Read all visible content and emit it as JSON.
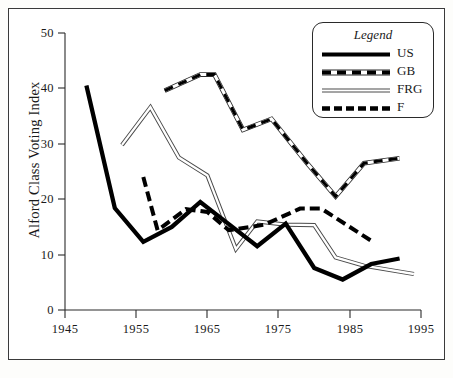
{
  "chart_data": {
    "type": "line",
    "title": "",
    "xlabel": "",
    "ylabel": "Alford Class Voting Index",
    "xlim": [
      1945,
      1995
    ],
    "ylim": [
      0,
      50
    ],
    "xticks": [
      "1945",
      "1955",
      "1965",
      "1975",
      "1985",
      "1995"
    ],
    "yticks": [
      "0",
      "10",
      "20",
      "30",
      "40",
      "50"
    ],
    "grid": false,
    "legend_position": "top-right",
    "legend_title": "Legend",
    "series": [
      {
        "name": "US",
        "style": "solid-thick-black",
        "color": "#000000",
        "points": [
          [
            1948,
            40.5
          ],
          [
            1952,
            18.4
          ],
          [
            1956,
            12.3
          ],
          [
            1960,
            15.0
          ],
          [
            1964,
            19.5
          ],
          [
            1968,
            15.5
          ],
          [
            1972,
            11.5
          ],
          [
            1976,
            15.6
          ],
          [
            1980,
            7.6
          ],
          [
            1984,
            5.5
          ],
          [
            1988,
            8.3
          ],
          [
            1992,
            9.3
          ]
        ]
      },
      {
        "name": "GB",
        "style": "outline-with-dashes",
        "color": "#000000",
        "points": [
          [
            1959,
            39.6
          ],
          [
            1964,
            42.5
          ],
          [
            1966,
            42.5
          ],
          [
            1970,
            32.5
          ],
          [
            1974,
            34.5
          ],
          [
            1979,
            26.5
          ],
          [
            1983,
            20.5
          ],
          [
            1987,
            26.5
          ],
          [
            1992,
            27.4
          ]
        ]
      },
      {
        "name": "FRG",
        "style": "thin-double-outline",
        "color": "#555555",
        "points": [
          [
            1953,
            29.8
          ],
          [
            1957,
            36.6
          ],
          [
            1961,
            27.5
          ],
          [
            1965,
            24.3
          ],
          [
            1969,
            11.0
          ],
          [
            1972,
            16.0
          ],
          [
            1976,
            15.4
          ],
          [
            1980,
            15.3
          ],
          [
            1983,
            9.5
          ],
          [
            1987,
            8.0
          ],
          [
            1994,
            6.5
          ]
        ]
      },
      {
        "name": "F",
        "style": "dashed-thick-black",
        "points": [
          [
            1956,
            24.0
          ],
          [
            1958,
            14.4
          ],
          [
            1962,
            18.2
          ],
          [
            1965,
            17.7
          ],
          [
            1968,
            14.4
          ],
          [
            1973,
            15.4
          ],
          [
            1978,
            18.3
          ],
          [
            1981,
            18.3
          ],
          [
            1988,
            12.5
          ]
        ]
      }
    ]
  },
  "legend": {
    "title": "Legend",
    "entries": [
      {
        "label": "US",
        "key": "solid-thick-black"
      },
      {
        "label": "GB",
        "key": "outline-with-dashes"
      },
      {
        "label": "FRG",
        "key": "thin-double-outline"
      },
      {
        "label": "F",
        "key": "dashed-thick-black"
      }
    ]
  },
  "axes": {
    "y_title": "Alford Class Voting Index",
    "y_ticks": [
      "50",
      "40",
      "30",
      "20",
      "10",
      "0"
    ],
    "x_ticks": [
      "1945",
      "1955",
      "1965",
      "1975",
      "1985",
      "1995"
    ]
  },
  "footer": {
    "mark": ""
  }
}
